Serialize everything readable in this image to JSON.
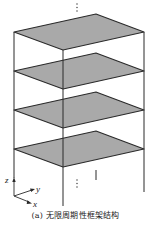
{
  "figure": {
    "caption": "(a) 无限周期性框架结构",
    "colors": {
      "slab_fill": "#a9a9a9",
      "line": "#2a2a2a",
      "background": "#ffffff"
    },
    "axes": {
      "z_label": "z",
      "y_label": "y",
      "x_label": "x"
    },
    "continuation_marks": {
      "top": "⋮",
      "bottom": "⋮"
    },
    "slab_count": 4
  }
}
